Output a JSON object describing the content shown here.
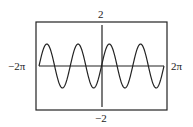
{
  "chart_data": {
    "type": "line",
    "title": "",
    "function": "y = sin(2x)",
    "xlabel": "",
    "ylabel": "",
    "xlim": [
      -6.2832,
      6.2832
    ],
    "ylim": [
      -2,
      2
    ],
    "tick_labels": {
      "xmin": "−2π",
      "xmax": "2π",
      "ymax": "2",
      "ymin": "−2"
    },
    "series": [
      {
        "name": "sin(2x)",
        "amplitude": 1,
        "period": 3.1416,
        "x": [
          -6.2832,
          -5.4978,
          -4.7124,
          -3.927,
          -3.1416,
          -2.3562,
          -1.5708,
          -0.7854,
          0,
          0.7854,
          1.5708,
          2.3562,
          3.1416,
          3.927,
          4.7124,
          5.4978,
          6.2832
        ],
        "values": [
          0,
          1,
          0,
          -1,
          0,
          1,
          0,
          -1,
          0,
          1,
          0,
          -1,
          0,
          1,
          0,
          -1,
          0
        ]
      }
    ],
    "grid": false
  },
  "labels": {
    "ymax": "2",
    "ymin": "−2",
    "xmin": "−2π",
    "xmax": "2π"
  }
}
